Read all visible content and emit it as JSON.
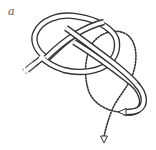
{
  "figure": {
    "panel_label": "a",
    "colors": {
      "rope_outline": "#333333",
      "rope_fill": "#ffffff",
      "dotted_path": "#333333",
      "background": "#ffffff"
    },
    "elements": [
      {
        "name": "standing-part",
        "style": "double-line tube"
      },
      {
        "name": "loop",
        "style": "double-line tube"
      },
      {
        "name": "working-end",
        "style": "double-line tube",
        "end": "arrowhead"
      },
      {
        "name": "next-path",
        "style": "dotted",
        "end": "arrowhead"
      }
    ]
  }
}
